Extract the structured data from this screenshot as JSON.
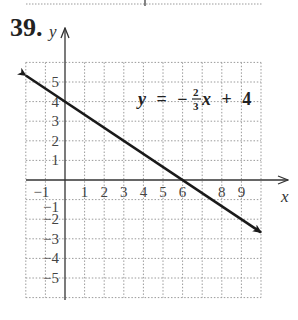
{
  "problem": {
    "number": "39."
  },
  "axes": {
    "x_label": "x",
    "y_label": "y"
  },
  "equation": {
    "lhs": "y",
    "equals": "=",
    "sign": "−",
    "numerator": "2",
    "denominator": "3",
    "var": "x",
    "plus": "+",
    "constant": "4",
    "full_text": "y = −(2/3)x + 4"
  },
  "colors": {
    "line": "#1a1a1a",
    "grid": "#9a9a9a",
    "axis": "#333333",
    "text": "#333333"
  },
  "chart_data": {
    "type": "line",
    "title": "",
    "xlabel": "x",
    "ylabel": "y",
    "xlim": [
      -2,
      10
    ],
    "ylim": [
      -6,
      6
    ],
    "grid": true,
    "grid_style": "dotted",
    "x_tick_labels": [
      "−1",
      "1",
      "2",
      "3",
      "4",
      "5",
      "6",
      "8",
      "9"
    ],
    "x_tick_values": [
      -1,
      1,
      2,
      3,
      4,
      5,
      6,
      8,
      9
    ],
    "y_tick_labels": [
      "5",
      "4",
      "3",
      "2",
      "1",
      "−1",
      "−2",
      "−3",
      "−4",
      "−5"
    ],
    "y_tick_values": [
      5,
      4,
      3,
      2,
      1,
      -1,
      -2,
      -3,
      -4,
      -5
    ],
    "annotations": [
      "y = −(2/3)x + 4"
    ],
    "series": [
      {
        "name": "y = −(2/3)x + 4",
        "slope": -0.6667,
        "intercept": 4,
        "x": [
          -2,
          0,
          3,
          6,
          10
        ],
        "y": [
          5.33,
          4,
          2,
          0,
          -2.67
        ],
        "arrows": "both"
      }
    ]
  }
}
